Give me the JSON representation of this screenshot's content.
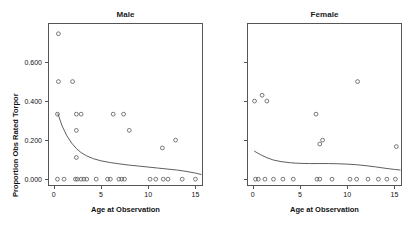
{
  "figure": {
    "ylabel": "Proportion Obs Rated Torpor",
    "xlabel_left": "Age at Observation",
    "xlabel_right": "Age at Observation",
    "panel_left_title": "Male",
    "panel_right_title": "Female",
    "point_color": "#4d4d4d",
    "line_color": "#4d4d4d",
    "axis_color": "#555555"
  },
  "chart_data": [
    {
      "type": "scatter",
      "title": "Male",
      "xlabel": "Age at Observation",
      "ylabel": "Proportion Obs Rated Torpor",
      "xlim": [
        -0.6,
        15.8
      ],
      "ylim": [
        -0.035,
        0.8
      ],
      "xticks": [
        0,
        5,
        10,
        15
      ],
      "yticks": [
        0.0,
        0.2,
        0.4,
        0.6
      ],
      "xticklabels": [
        "0",
        "5",
        "10",
        "15"
      ],
      "yticklabels": [
        "0.000",
        "0.200",
        "0.400",
        "0.600"
      ],
      "grid": false,
      "legend": null,
      "x": [
        0.5,
        0.5,
        2.0,
        0.4,
        2.4,
        2.9,
        6.3,
        7.4,
        2.4,
        8.0,
        12.9,
        11.5,
        2.4,
        0.4,
        1.1,
        2.3,
        2.5,
        2.9,
        3.2,
        3.5,
        4.5,
        5.7,
        6.0,
        6.9,
        7.2,
        7.5,
        10.2,
        10.8,
        11.6,
        12.1,
        13.6,
        15.0
      ],
      "y": [
        0.745,
        0.5,
        0.5,
        0.333,
        0.333,
        0.333,
        0.333,
        0.333,
        0.25,
        0.25,
        0.2,
        0.16,
        0.111,
        0.0,
        0.0,
        0.0,
        0.0,
        0.0,
        0.0,
        0.0,
        0.0,
        0.0,
        0.0,
        0.0,
        0.0,
        0.0,
        0.0,
        0.0,
        0.0,
        0.0,
        0.0,
        0.0
      ],
      "fit_line": {
        "x": [
          0.45,
          0.9,
          1.4,
          1.9,
          2.4,
          2.9,
          3.5,
          4.2,
          5.0,
          6.0,
          7.0,
          8.0,
          9.0,
          10.0,
          11.0,
          12.0,
          13.0,
          14.0,
          15.0,
          15.6
        ],
        "y": [
          0.335,
          0.272,
          0.222,
          0.185,
          0.157,
          0.136,
          0.119,
          0.105,
          0.094,
          0.085,
          0.078,
          0.072,
          0.067,
          0.062,
          0.057,
          0.052,
          0.047,
          0.04,
          0.031,
          0.024
        ]
      }
    },
    {
      "type": "scatter",
      "title": "Female",
      "xlabel": "Age at Observation",
      "ylabel": "Proportion Obs Rated Torpor",
      "xlim": [
        -0.6,
        15.8
      ],
      "ylim": [
        -0.035,
        0.8
      ],
      "xticks": [
        0,
        5,
        10,
        15
      ],
      "yticks": [
        0.0,
        0.2,
        0.4,
        0.6
      ],
      "xticklabels": [
        "0",
        "5",
        "10",
        "15"
      ],
      "yticklabels": [
        "",
        "",
        "",
        ""
      ],
      "grid": false,
      "legend": null,
      "x": [
        11.1,
        1.0,
        0.2,
        1.5,
        6.7,
        7.4,
        7.1,
        15.2,
        0.3,
        0.6,
        1.3,
        2.2,
        3.2,
        4.3,
        6.8,
        7.1,
        8.4,
        10.3,
        11.0,
        12.2,
        13.3,
        14.2,
        15.1
      ],
      "y": [
        0.5,
        0.43,
        0.4,
        0.4,
        0.333,
        0.2,
        0.18,
        0.167,
        0.0,
        0.0,
        0.0,
        0.0,
        0.0,
        0.0,
        0.0,
        0.0,
        0.0,
        0.0,
        0.0,
        0.0,
        0.0,
        0.0,
        0.0
      ],
      "fit_line": {
        "x": [
          0.2,
          0.8,
          1.5,
          2.2,
          3.0,
          4.0,
          5.0,
          6.0,
          7.0,
          8.0,
          9.0,
          10.0,
          11.0,
          12.0,
          13.0,
          14.0,
          15.0,
          15.6
        ],
        "y": [
          0.143,
          0.126,
          0.11,
          0.098,
          0.09,
          0.084,
          0.081,
          0.08,
          0.08,
          0.08,
          0.079,
          0.077,
          0.074,
          0.069,
          0.063,
          0.056,
          0.05,
          0.047
        ]
      }
    }
  ]
}
